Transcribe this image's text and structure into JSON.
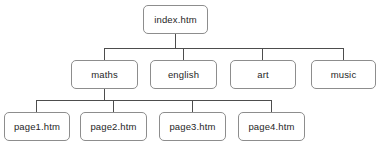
{
  "diagram": {
    "type": "site-map-tree",
    "title": "",
    "background_color": "#ffffff",
    "box_border_color": "#8d8d8d",
    "box_fill_color": "#ffffff",
    "connector_color": "#4d4d4d",
    "text_color": "#262626",
    "levels": [
      {
        "level": 1,
        "nodes": [
          {
            "id": "index",
            "label": "index.htm"
          }
        ]
      },
      {
        "level": 2,
        "nodes": [
          {
            "id": "maths",
            "label": "maths"
          },
          {
            "id": "english",
            "label": "english"
          },
          {
            "id": "art",
            "label": "art"
          },
          {
            "id": "music",
            "label": "music"
          }
        ]
      },
      {
        "level": 3,
        "nodes": [
          {
            "id": "page1",
            "label": "page1.htm"
          },
          {
            "id": "page2",
            "label": "page2.htm"
          },
          {
            "id": "page3",
            "label": "page3.htm"
          },
          {
            "id": "page4",
            "label": "page4.htm"
          }
        ]
      }
    ],
    "edges": [
      {
        "from": "index",
        "to": "maths"
      },
      {
        "from": "index",
        "to": "english"
      },
      {
        "from": "index",
        "to": "art"
      },
      {
        "from": "index",
        "to": "music"
      },
      {
        "from": "maths",
        "to": "page1"
      },
      {
        "from": "maths",
        "to": "page2"
      },
      {
        "from": "maths",
        "to": "page3"
      },
      {
        "from": "maths",
        "to": "page4"
      }
    ]
  }
}
